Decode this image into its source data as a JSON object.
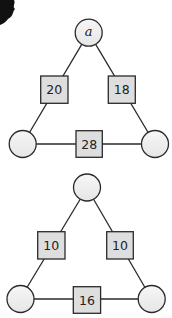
{
  "diagrams": [
    {
      "name": "triangle-1",
      "circles": {
        "top": "a",
        "left": "",
        "right": ""
      },
      "boxes": {
        "left_edge": "20",
        "right_edge": "18",
        "bottom_edge": "28"
      }
    },
    {
      "name": "triangle-2",
      "circles": {
        "top": "",
        "left": "",
        "right": ""
      },
      "boxes": {
        "left_edge": "10",
        "right_edge": "10",
        "bottom_edge": "16"
      }
    }
  ],
  "colors": {
    "stroke": "#2a2a2a",
    "box_fill": "#dedede",
    "circle_fill": "#ececec",
    "background": "#ffffff"
  }
}
